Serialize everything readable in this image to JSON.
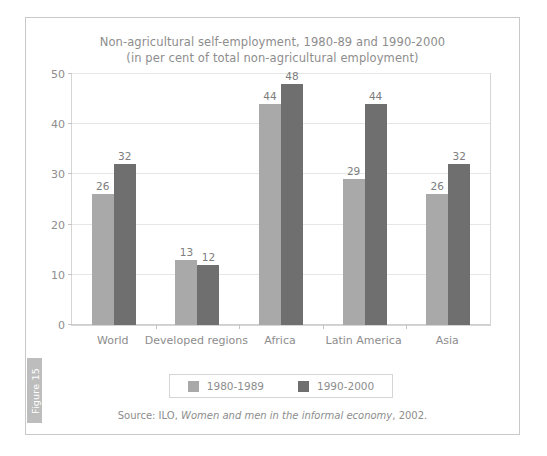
{
  "figure_tab": {
    "label": "Figure 15",
    "color": "#bdbdbd"
  },
  "chart_data": {
    "type": "bar",
    "title": "Non-agricultural self-employment, 1980-89 and 1990-2000",
    "subtitle": "(in per cent of total non-agricultural employment)",
    "xlabel": "",
    "ylabel": "",
    "ylim": [
      0,
      50
    ],
    "yticks": [
      0,
      10,
      20,
      30,
      40,
      50
    ],
    "ytick_labels": [
      "0",
      "10",
      "20",
      "30",
      "40",
      "50"
    ],
    "grid": true,
    "legend_position": "bottom",
    "categories": [
      "World",
      "Developed regions",
      "Africa",
      "Latin America",
      "Asia"
    ],
    "series": [
      {
        "name": "1980-1989",
        "color": "#a9a9a9",
        "values": [
          26,
          13,
          44,
          29,
          26
        ],
        "value_labels": [
          "26",
          "13",
          "44",
          "29",
          "26"
        ]
      },
      {
        "name": "1990-2000",
        "color": "#6f6f6f",
        "values": [
          32,
          12,
          48,
          44,
          32
        ],
        "value_labels": [
          "32",
          "12",
          "48",
          "44",
          "32"
        ]
      }
    ]
  },
  "source": {
    "prefix": "Source: ILO, ",
    "italic": "Women and men in the informal economy",
    "suffix": ", 2002."
  }
}
